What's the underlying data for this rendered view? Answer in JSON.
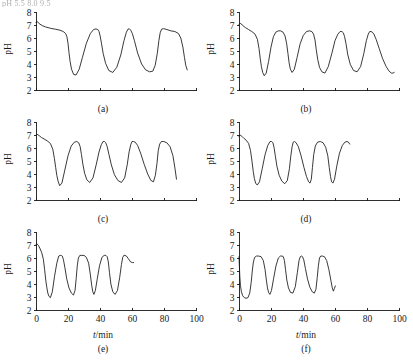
{
  "figure": {
    "scan_header_text": "pH 5.5                        8.0                       9.5",
    "yaxis_label": "pH",
    "xaxis_label_var": "t",
    "xaxis_label_unit": "/min",
    "y_ticks": [
      2,
      3,
      4,
      5,
      6,
      7,
      8
    ],
    "x_ticks": [
      0,
      20,
      40,
      60,
      80,
      100
    ],
    "x_tick_labels_visible_rows": [
      3
    ],
    "line_color": "#171717",
    "background_color": "#ffffff"
  },
  "chart_data": [
    {
      "type": "line",
      "title": "(a)",
      "xlabel": "t/min",
      "ylabel": "pH",
      "xlim": [
        0,
        100
      ],
      "ylim": [
        2,
        8
      ],
      "x_ticks": [
        0,
        20,
        40,
        60,
        80,
        100
      ],
      "y_ticks": [
        2,
        3,
        4,
        5,
        6,
        7,
        8
      ],
      "grid": false,
      "tick_labels_shown": {
        "x": false,
        "y": true
      },
      "series": [
        {
          "name": "pH",
          "x": [
            0,
            1,
            2,
            4,
            6,
            9,
            12,
            15,
            17,
            18.5,
            19.3,
            20,
            20.6,
            21.3,
            22.2,
            23.5,
            25,
            27,
            29,
            31.5,
            34,
            36,
            37.5,
            38.6,
            39.4,
            40.1,
            40.9,
            42,
            43.5,
            45.5,
            48,
            50.5,
            53,
            55,
            56.5,
            57.6,
            58.4,
            59.2,
            60.2,
            61.5,
            63.5,
            66,
            68.5,
            71,
            73,
            74.5,
            75.8,
            76.8,
            77.6,
            78.5,
            79.8,
            81.8,
            84.3,
            86.8,
            89,
            90.5,
            91.8,
            92.8,
            93.6,
            94.5
          ],
          "y": [
            7.2,
            7.25,
            7.1,
            6.95,
            6.85,
            6.75,
            6.68,
            6.6,
            6.5,
            6.35,
            6.1,
            5.6,
            4.9,
            4.2,
            3.6,
            3.2,
            3.15,
            3.6,
            4.5,
            5.6,
            6.35,
            6.65,
            6.7,
            6.65,
            6.5,
            6.15,
            5.6,
            4.8,
            4.05,
            3.5,
            3.35,
            3.75,
            4.7,
            5.8,
            6.45,
            6.7,
            6.7,
            6.6,
            6.35,
            5.8,
            4.85,
            4.0,
            3.55,
            3.4,
            3.45,
            3.9,
            4.8,
            5.8,
            6.4,
            6.68,
            6.72,
            6.65,
            6.55,
            6.5,
            6.35,
            6.0,
            5.3,
            4.5,
            3.9,
            3.55
          ]
        }
      ]
    },
    {
      "type": "line",
      "title": "(b)",
      "xlabel": "t/min",
      "ylabel": "pH",
      "xlim": [
        0,
        100
      ],
      "ylim": [
        2,
        8
      ],
      "x_ticks": [
        0,
        20,
        40,
        60,
        80,
        100
      ],
      "y_ticks": [
        2,
        3,
        4,
        5,
        6,
        7,
        8
      ],
      "grid": false,
      "tick_labels_shown": {
        "x": false,
        "y": true
      },
      "series": [
        {
          "name": "pH",
          "x": [
            0,
            0.8,
            2,
            4,
            6,
            8,
            10,
            11.5,
            12.5,
            13.3,
            14,
            14.8,
            15.8,
            17,
            18.5,
            20,
            21.5,
            23,
            24.5,
            26,
            27.5,
            28.8,
            29.8,
            30.6,
            31.3,
            32.1,
            33.2,
            34.6,
            36.3,
            38.2,
            40.2,
            42.2,
            44,
            45.5,
            46.6,
            47.5,
            48.3,
            49.2,
            50.3,
            51.8,
            53.7,
            55.8,
            58,
            60,
            61.8,
            63.2,
            64.3,
            65.2,
            66,
            66.9,
            68,
            69.6,
            71.6,
            73.8,
            76,
            78,
            79.6,
            80.8,
            81.7,
            82.5,
            83.3,
            84.3,
            85.7,
            87.6,
            89.8,
            92,
            93.8,
            95.2,
            96.2,
            97
          ],
          "y": [
            7.05,
            7.15,
            7.0,
            6.8,
            6.65,
            6.5,
            6.3,
            5.9,
            5.2,
            4.4,
            3.8,
            3.35,
            3.1,
            3.3,
            4.2,
            5.3,
            6.1,
            6.45,
            6.55,
            6.55,
            6.45,
            6.15,
            5.55,
            4.8,
            4.1,
            3.6,
            3.35,
            3.6,
            4.5,
            5.55,
            6.2,
            6.5,
            6.55,
            6.5,
            6.3,
            5.85,
            5.1,
            4.35,
            3.75,
            3.4,
            3.3,
            3.8,
            4.8,
            5.8,
            6.3,
            6.5,
            6.5,
            6.4,
            6.1,
            5.55,
            4.7,
            3.95,
            3.5,
            3.4,
            3.8,
            4.8,
            5.8,
            6.3,
            6.5,
            6.5,
            6.45,
            6.3,
            5.9,
            5.2,
            4.4,
            3.8,
            3.45,
            3.3,
            3.3,
            3.35
          ]
        }
      ]
    },
    {
      "type": "line",
      "title": "(c)",
      "xlabel": "t/min",
      "ylabel": "pH",
      "xlim": [
        0,
        100
      ],
      "ylim": [
        2,
        8
      ],
      "x_ticks": [
        0,
        20,
        40,
        60,
        80,
        100
      ],
      "y_ticks": [
        2,
        3,
        4,
        5,
        6,
        7,
        8
      ],
      "grid": false,
      "tick_labels_shown": {
        "x": false,
        "y": true
      },
      "series": [
        {
          "name": "pH",
          "x": [
            0,
            0.8,
            2,
            3.5,
            5,
            7,
            9,
            10.5,
            11.5,
            12.3,
            13,
            13.8,
            14.8,
            16.2,
            18,
            20,
            22,
            24,
            25.5,
            26.7,
            27.6,
            28.4,
            29.3,
            30.4,
            31.8,
            33.6,
            35.6,
            37.6,
            39.4,
            40.8,
            41.9,
            42.8,
            43.6,
            44.5,
            45.6,
            47.1,
            49,
            51.2,
            53.4,
            55.4,
            57,
            58.2,
            59.2,
            60,
            60.9,
            62,
            63.5,
            65.4,
            67.6,
            69.8,
            71.8,
            73.4,
            74.6,
            75.6,
            76.4,
            77.3,
            78.4,
            79.9,
            81.8,
            83.8,
            85.6,
            86.9,
            87.8
          ],
          "y": [
            6.95,
            7.05,
            6.95,
            6.8,
            6.7,
            6.55,
            6.35,
            5.9,
            5.2,
            4.5,
            3.9,
            3.45,
            3.1,
            3.3,
            4.3,
            5.4,
            6.15,
            6.45,
            6.5,
            6.4,
            6.1,
            5.5,
            4.75,
            4.05,
            3.55,
            3.35,
            3.7,
            4.7,
            5.7,
            6.25,
            6.5,
            6.5,
            6.4,
            6.1,
            5.5,
            4.7,
            3.95,
            3.5,
            3.35,
            3.7,
            4.7,
            5.7,
            6.25,
            6.5,
            6.5,
            6.45,
            6.2,
            5.6,
            4.75,
            4.0,
            3.5,
            3.4,
            3.9,
            4.8,
            5.8,
            6.3,
            6.5,
            6.5,
            6.4,
            6.1,
            5.4,
            4.4,
            3.6
          ]
        }
      ]
    },
    {
      "type": "line",
      "title": "(d)",
      "xlabel": "t/min",
      "ylabel": "pH",
      "xlim": [
        0,
        100
      ],
      "ylim": [
        2,
        8
      ],
      "x_ticks": [
        0,
        20,
        40,
        60,
        80,
        100
      ],
      "y_ticks": [
        2,
        3,
        4,
        5,
        6,
        7,
        8
      ],
      "grid": false,
      "tick_labels_shown": {
        "x": false,
        "y": true
      },
      "series": [
        {
          "name": "pH",
          "x": [
            0,
            0.7,
            1.8,
            3,
            4.5,
            6,
            7.2,
            8.1,
            8.9,
            9.6,
            10.4,
            11.4,
            12.8,
            14.5,
            16.3,
            18,
            19.4,
            20.4,
            21.2,
            21.9,
            22.7,
            23.7,
            25.1,
            26.8,
            28.6,
            30.2,
            31.5,
            32.4,
            33.2,
            33.9,
            34.7,
            35.7,
            37.1,
            38.8,
            40.6,
            42.2,
            43.5,
            44.4,
            45.2,
            45.9,
            46.7,
            47.7,
            49.1,
            50.8,
            52.6,
            54.2,
            55.5,
            56.4,
            57.2,
            57.9,
            58.7,
            59.7,
            61.1,
            62.8,
            64.6,
            66.2,
            67.5,
            68.4,
            69.2
          ],
          "y": [
            6.9,
            7.0,
            6.9,
            6.75,
            6.6,
            6.35,
            5.8,
            5.0,
            4.2,
            3.65,
            3.3,
            3.15,
            3.4,
            4.4,
            5.5,
            6.2,
            6.5,
            6.5,
            6.4,
            6.05,
            5.4,
            4.6,
            3.9,
            3.45,
            3.25,
            3.5,
            4.4,
            5.4,
            6.1,
            6.45,
            6.5,
            6.4,
            6.1,
            5.4,
            4.5,
            3.8,
            3.4,
            3.3,
            3.6,
            4.5,
            5.5,
            6.15,
            6.45,
            6.5,
            6.4,
            6.05,
            5.4,
            4.5,
            3.8,
            3.4,
            3.3,
            3.6,
            4.6,
            5.6,
            6.2,
            6.45,
            6.5,
            6.45,
            6.3
          ]
        }
      ]
    },
    {
      "type": "line",
      "title": "(e)",
      "xlabel": "t/min",
      "ylabel": "pH",
      "xlim": [
        0,
        100
      ],
      "ylim": [
        2,
        8
      ],
      "x_ticks": [
        0,
        20,
        40,
        60,
        80,
        100
      ],
      "y_ticks": [
        2,
        3,
        4,
        5,
        6,
        7,
        8
      ],
      "grid": false,
      "tick_labels_shown": {
        "x": true,
        "y": true
      },
      "series": [
        {
          "name": "pH",
          "x": [
            0,
            0.6,
            1.6,
            2.6,
            3.6,
            4.6,
            5.4,
            6.1,
            6.8,
            7.4,
            8.1,
            9,
            10.2,
            11.6,
            13,
            14.2,
            15.1,
            15.8,
            16.4,
            17.1,
            18,
            19.2,
            20.6,
            22.1,
            23.4,
            24.4,
            25.1,
            25.8,
            26.5,
            27.4,
            28.6,
            30,
            31.5,
            32.9,
            34,
            34.8,
            35.5,
            36.2,
            37.1,
            38.3,
            39.7,
            41.2,
            42.6,
            43.7,
            44.5,
            45.2,
            45.9,
            46.8,
            48,
            49.4,
            50.9,
            52.3,
            53.4,
            54.2,
            54.9,
            55.6,
            56.5,
            57.7,
            59.1,
            60.3,
            61
          ],
          "y": [
            7.05,
            7.1,
            6.95,
            6.7,
            6.4,
            5.9,
            5.1,
            4.3,
            3.7,
            3.3,
            3.05,
            2.95,
            3.4,
            4.6,
            5.6,
            6.15,
            6.2,
            6.2,
            6.15,
            5.9,
            5.3,
            4.4,
            3.7,
            3.3,
            3.15,
            3.5,
            4.4,
            5.4,
            6.0,
            6.2,
            6.2,
            6.2,
            6.05,
            5.6,
            4.7,
            3.9,
            3.4,
            3.2,
            3.5,
            4.4,
            5.4,
            6.05,
            6.2,
            6.2,
            6.1,
            5.7,
            4.9,
            4.0,
            3.4,
            3.2,
            3.5,
            4.5,
            5.5,
            6.05,
            6.2,
            6.2,
            6.15,
            5.95,
            5.7,
            5.65,
            5.65
          ]
        }
      ]
    },
    {
      "type": "line",
      "title": "(f)",
      "xlabel": "t/min",
      "ylabel": "pH",
      "xlim": [
        0,
        100
      ],
      "ylim": [
        2,
        8
      ],
      "x_ticks": [
        0,
        20,
        40,
        60,
        80,
        100
      ],
      "y_ticks": [
        2,
        3,
        4,
        5,
        6,
        7,
        8
      ],
      "grid": false,
      "tick_labels_shown": {
        "x": true,
        "y": true
      },
      "series": [
        {
          "name": "pH",
          "x": [
            0,
            0.2,
            0.5,
            0.9,
            1.5,
            2.3,
            3.3,
            4.4,
            5.6,
            6.7,
            7.6,
            8.3,
            9,
            9.8,
            10.9,
            12.3,
            13.8,
            15.2,
            16.3,
            17.1,
            17.8,
            18.5,
            19.3,
            20.3,
            21.6,
            23.1,
            24.6,
            25.9,
            26.9,
            27.7,
            28.4,
            29.1,
            29.9,
            30.9,
            32.2,
            33.7,
            35.2,
            36.5,
            37.5,
            38.3,
            39,
            39.7,
            40.5,
            41.5,
            42.8,
            44.3,
            45.8,
            47.1,
            48.1,
            48.9,
            49.6,
            50.3,
            51.1,
            52.1,
            53.4,
            54.8,
            56.2,
            57.4,
            58.3,
            59,
            59.6,
            60.2
          ],
          "y": [
            6.1,
            5.5,
            4.6,
            3.9,
            3.4,
            3.1,
            2.95,
            2.9,
            2.95,
            3.3,
            4.1,
            5.0,
            5.7,
            6.05,
            6.15,
            6.15,
            6.1,
            5.8,
            5.1,
            4.3,
            3.7,
            3.35,
            3.2,
            3.5,
            4.4,
            5.4,
            6.0,
            6.15,
            6.15,
            6.1,
            5.8,
            5.1,
            4.3,
            3.7,
            3.35,
            3.3,
            3.8,
            4.9,
            5.8,
            6.1,
            6.15,
            6.1,
            5.85,
            5.2,
            4.4,
            3.75,
            3.4,
            3.3,
            3.6,
            4.5,
            5.4,
            6.0,
            6.15,
            6.15,
            6.1,
            5.8,
            5.1,
            4.3,
            3.7,
            3.45,
            3.65,
            3.85
          ]
        }
      ]
    }
  ]
}
